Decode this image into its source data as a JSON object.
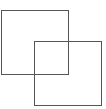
{
  "diagram": {
    "shapes": [
      {
        "type": "square",
        "x": 1.5,
        "y": 10.5,
        "width": 67,
        "height": 64,
        "stroke": "#555555"
      },
      {
        "type": "square",
        "x": 34.5,
        "y": 41.5,
        "width": 67,
        "height": 64,
        "stroke": "#555555"
      }
    ]
  }
}
